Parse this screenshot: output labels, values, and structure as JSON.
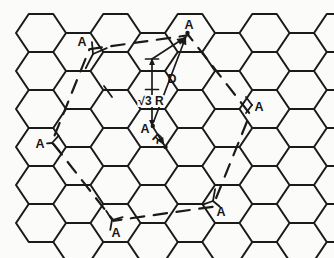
{
  "figure": {
    "name": "honeycomb-lattice-overlayer-diagram",
    "background": "#fbfbfa",
    "ink": "#1a1a1a",
    "width": 334,
    "height": 258
  },
  "labels": [
    {
      "text": "A",
      "x": 189,
      "y": 25
    },
    {
      "text": "A",
      "x": 82,
      "y": 42
    },
    {
      "text": "A",
      "x": 259,
      "y": 107
    },
    {
      "text": "A",
      "x": 40,
      "y": 144
    },
    {
      "text": "A",
      "x": 221,
      "y": 212
    },
    {
      "text": "A",
      "x": 116,
      "y": 233
    },
    {
      "text": "A",
      "x": 145,
      "y": 129
    },
    {
      "text": "D",
      "x": 172,
      "y": 79
    },
    {
      "text": "R",
      "x": 157,
      "y": 139,
      "rotate": 42
    },
    {
      "text": "√3 R",
      "x": 151,
      "y": 101,
      "bg": true
    }
  ],
  "lattice": {
    "first_col_x": 41,
    "col_pitch": 37.25,
    "n_cols": 9,
    "even_col_first_y": 33,
    "odd_col_first_y": 52,
    "row_pitch": 38,
    "n_rows": 6,
    "half_edge": 12.25,
    "vertex_dx": 25,
    "half_height": 19,
    "stroke_width": 2
  },
  "overlay_cell": {
    "center": [
      151,
      128
    ],
    "radius": 100,
    "angle_start_deg": -68,
    "dash": "13.5 9.5",
    "dash_offset": 7,
    "stroke_width": 2.2
  },
  "measures": {
    "vertical": {
      "x": 152,
      "y_top": 59,
      "y_bottom": 125.5
    },
    "ticks": [
      [
        145.5,
        59,
        158.5,
        59
      ],
      [
        145.5,
        89.5,
        158.5,
        89.5
      ]
    ],
    "r_arrow": {
      "from": [
        153,
        127
      ],
      "to": [
        164.5,
        145.5
      ]
    },
    "d_arrow": {
      "from": [
        153.5,
        122
      ],
      "to": [
        186,
        36.5
      ]
    },
    "path_arrow": {
      "from": [
        152,
        59
      ],
      "to": [
        185,
        37.5
      ]
    },
    "dots": [
      [
        187.5,
        33
      ],
      [
        152.8,
        126
      ],
      [
        165.5,
        147
      ]
    ],
    "stroke_width": 1.7
  },
  "site_marks": [
    {
      "center": [
        93,
        54
      ],
      "prongs": [
        [
          -95,
          12
        ],
        [
          117,
          16
        ],
        [
          -23,
          15
        ]
      ]
    },
    {
      "center": [
        252,
        105
      ],
      "prongs": [
        [
          -127,
          10
        ],
        [
          127,
          10
        ]
      ]
    },
    {
      "center": [
        52,
        143
      ],
      "prongs": [
        [
          -48,
          10
        ],
        [
          48,
          11
        ],
        [
          175,
          5
        ]
      ]
    },
    {
      "center": [
        213,
        201
      ],
      "prongs": [
        [
          -80,
          12
        ],
        [
          160,
          10
        ],
        [
          40,
          9
        ]
      ]
    },
    {
      "center": [
        112,
        220
      ],
      "prongs": [
        [
          -122,
          11
        ],
        [
          -15,
          11
        ],
        [
          100,
          10
        ]
      ]
    }
  ],
  "extra_segments": [
    [
      104,
      86,
      112,
      97
    ]
  ]
}
